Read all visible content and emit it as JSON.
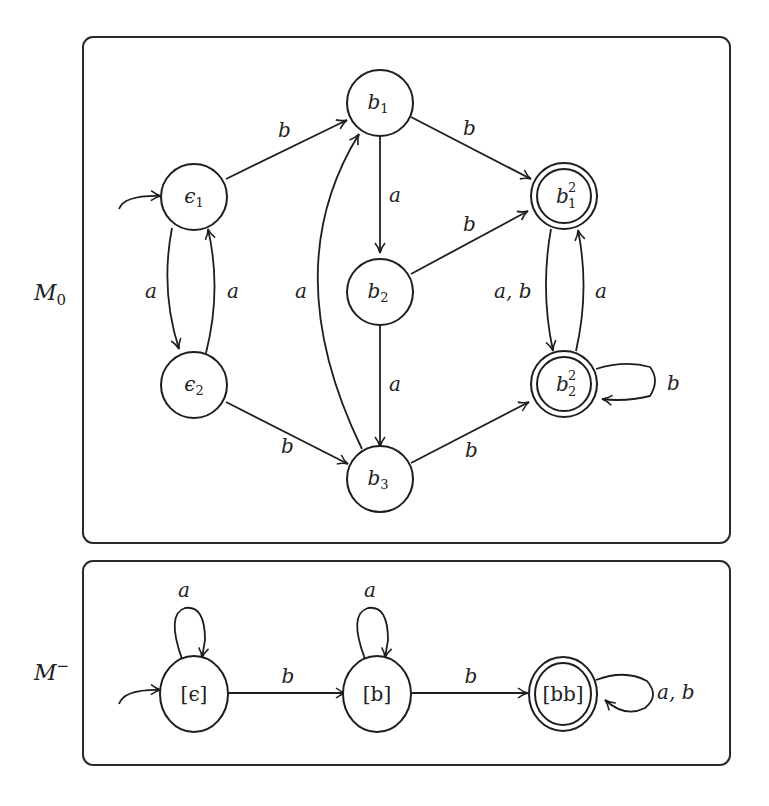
{
  "machines": [
    {
      "name": "M",
      "subscript": "0",
      "label": "M0",
      "states": [
        {
          "id": "e1",
          "base": "ϵ",
          "sub": "1",
          "sup": "",
          "initial": true,
          "accepting": false
        },
        {
          "id": "e2",
          "base": "ϵ",
          "sub": "2",
          "sup": "",
          "initial": false,
          "accepting": false
        },
        {
          "id": "b1",
          "base": "b",
          "sub": "1",
          "sup": "",
          "initial": false,
          "accepting": false
        },
        {
          "id": "b2",
          "base": "b",
          "sub": "2",
          "sup": "",
          "initial": false,
          "accepting": false
        },
        {
          "id": "b3",
          "base": "b",
          "sub": "3",
          "sup": "",
          "initial": false,
          "accepting": false
        },
        {
          "id": "b12",
          "base": "b",
          "sub": "1",
          "sup": "2",
          "initial": false,
          "accepting": true
        },
        {
          "id": "b22",
          "base": "b",
          "sub": "2",
          "sup": "2",
          "initial": false,
          "accepting": true
        }
      ],
      "transitions": [
        {
          "from": "e1",
          "to": "b1",
          "label": "b"
        },
        {
          "from": "e1",
          "to": "e2",
          "label": "a"
        },
        {
          "from": "e2",
          "to": "e1",
          "label": "a"
        },
        {
          "from": "e2",
          "to": "b3",
          "label": "b"
        },
        {
          "from": "b3",
          "to": "b1",
          "label": "a"
        },
        {
          "from": "b1",
          "to": "b2",
          "label": "a"
        },
        {
          "from": "b2",
          "to": "b3",
          "label": "a"
        },
        {
          "from": "b1",
          "to": "b12",
          "label": "b"
        },
        {
          "from": "b2",
          "to": "b12",
          "label": "b"
        },
        {
          "from": "b3",
          "to": "b22",
          "label": "b"
        },
        {
          "from": "b12",
          "to": "b22",
          "label": "a, b"
        },
        {
          "from": "b22",
          "to": "b12",
          "label": "a"
        },
        {
          "from": "b22",
          "to": "b22",
          "label": "b"
        }
      ]
    },
    {
      "name": "M",
      "superscript": "−",
      "label": "M−",
      "states": [
        {
          "id": "q0",
          "text": "[ϵ]",
          "initial": true,
          "accepting": false
        },
        {
          "id": "q1",
          "text": "[b]",
          "initial": false,
          "accepting": false
        },
        {
          "id": "q2",
          "text": "[bb]",
          "initial": false,
          "accepting": true
        }
      ],
      "transitions": [
        {
          "from": "q0",
          "to": "q0",
          "label": "a"
        },
        {
          "from": "q0",
          "to": "q1",
          "label": "b"
        },
        {
          "from": "q1",
          "to": "q1",
          "label": "a"
        },
        {
          "from": "q1",
          "to": "q2",
          "label": "b"
        },
        {
          "from": "q2",
          "to": "q2",
          "label": "a, b"
        }
      ]
    }
  ],
  "labels": {
    "m0_name": "M",
    "m0_sub": "0",
    "mminus_name": "M",
    "mminus_sup": "−",
    "e1_base": "ϵ",
    "e1_sub": "1",
    "e2_base": "ϵ",
    "e2_sub": "2",
    "b1_base": "b",
    "b1_sub": "1",
    "b2_base": "b",
    "b2_sub": "2",
    "b3_base": "b",
    "b3_sub": "3",
    "b12_base": "b",
    "b12_sub": "1",
    "b12_sup": "2",
    "b22_base": "b",
    "b22_sub": "2",
    "b22_sup": "2",
    "q0_text": "[ϵ]",
    "q1_text": "[b]",
    "q2_text": "[bb]",
    "t_e1_b1": "b",
    "t_e1_e2": "a",
    "t_e2_e1": "a",
    "t_e2_b3": "b",
    "t_b3_b1": "a",
    "t_b1_b2": "a",
    "t_b2_b3": "a",
    "t_b1_b12": "b",
    "t_b2_b12": "b",
    "t_b3_b22": "b",
    "t_b12_b22": "a, b",
    "t_b22_b12": "a",
    "t_b22_loop": "b",
    "t_q0_loop": "a",
    "t_q0_q1": "b",
    "t_q1_loop": "a",
    "t_q1_q2": "b",
    "t_q2_loop": "a, b"
  }
}
